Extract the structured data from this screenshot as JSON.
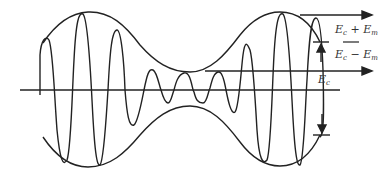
{
  "diagram": {
    "type": "amplitude-modulated-wave",
    "labels": {
      "ec_plus_em": "E",
      "ec_plus_em_sub1": "c",
      "ec_plus_em_op": " + E",
      "ec_plus_em_sub2": "m",
      "ec_minus_em": "E",
      "ec_minus_em_sub1": "c",
      "ec_minus_em_op": " − E",
      "ec_minus_em_sub2": "m",
      "ec": "E",
      "ec_sub": "c"
    },
    "colors": {
      "stroke": "#222222",
      "background": "#ffffff"
    }
  }
}
